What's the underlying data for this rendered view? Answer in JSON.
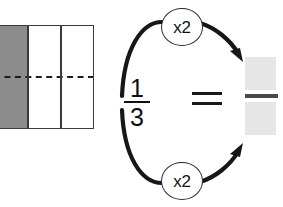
{
  "diagram": {
    "background_color": "#ffffff"
  },
  "area_model": {
    "name": "rectangle-thirds",
    "total_parts": 3,
    "shaded_parts": 1,
    "shaded_color": "#8c8c8c",
    "empty_color": "#ffffff",
    "outline_color": "#3a3a3a",
    "halving_line": "dashed-horizontal",
    "halving_line_color": "#1c1c1c"
  },
  "equation": {
    "left_fraction": {
      "numerator": "1",
      "denominator": "3"
    },
    "relation": "=",
    "right_fraction": {
      "numerator": "",
      "denominator": "",
      "blank_color": "#e6e6e6",
      "bar_color": "#4b4b4b"
    }
  },
  "arrows": {
    "top": {
      "label": "x2",
      "direction": "left-to-right",
      "curve": "arc-over"
    },
    "bottom": {
      "label": "x2",
      "direction": "left-to-right",
      "curve": "arc-under"
    },
    "stroke_color": "#171717"
  }
}
